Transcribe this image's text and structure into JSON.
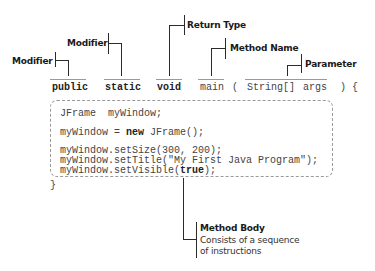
{
  "annotations": {
    "modifier_1": "Modifier",
    "modifier_2": "Modifier",
    "return_type": "Return Type",
    "method_name": "Method Name",
    "parameter": "Parameter",
    "method_body": "Method Body",
    "method_body_desc_1": "Consists of a sequence",
    "method_body_desc_2": "of instructions"
  },
  "signature": {
    "modifier_public": "public",
    "modifier_static": "static",
    "return_void": "void",
    "method_main": "main",
    "open_paren": "(",
    "param_type": "String[]",
    "param_name": "args",
    "close_paren_brace": ") {"
  },
  "body": {
    "line1": "JFrame  myWindow;",
    "line2_pre": "myWindow = ",
    "line2_kw": "new",
    "line2_post": " JFrame();",
    "line3": "myWindow.setSize(300, 200);",
    "line4": "myWindow.setTitle(\"My First Java Program\");",
    "line5_pre": "myWindow.setVisible(",
    "line5_kw": "true",
    "line5_post": ");",
    "closing_brace": "}"
  }
}
